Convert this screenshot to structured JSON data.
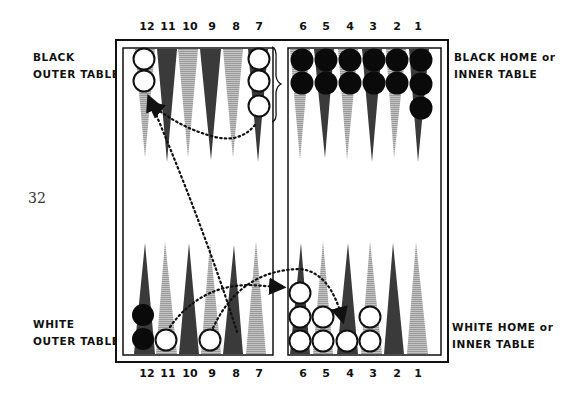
{
  "page_number": "32",
  "labels": {
    "black_outer": [
      "BLACK",
      "OUTER TABLE"
    ],
    "black_home": [
      "BLACK HOME or",
      "INNER TABLE"
    ],
    "white_outer": [
      "WHITE",
      "OUTER TABLE"
    ],
    "white_home": [
      "WHITE HOME or",
      "INNER TABLE"
    ]
  },
  "point_numbers_top": [
    "12",
    "11",
    "10",
    "9",
    "8",
    "7",
    "6",
    "5",
    "4",
    "3",
    "2",
    "1"
  ],
  "point_numbers_bottom": [
    "12",
    "11",
    "10",
    "9",
    "8",
    "7",
    "6",
    "5",
    "4",
    "3",
    "2",
    "1"
  ],
  "colors": {
    "dark_point": "#3a3a3a",
    "light_point": "#b9b9b9",
    "black_checker": "#0a0a0a",
    "white_checker": "#ffffff",
    "frame": "#111111"
  },
  "board": {
    "top_points": [
      {
        "point": 12,
        "shade": "light",
        "checkers": 2,
        "color": "white"
      },
      {
        "point": 11,
        "shade": "dark",
        "checkers": 0
      },
      {
        "point": 10,
        "shade": "light",
        "checkers": 0
      },
      {
        "point": 9,
        "shade": "dark",
        "checkers": 0
      },
      {
        "point": 8,
        "shade": "light",
        "checkers": 0
      },
      {
        "point": 7,
        "shade": "dark",
        "checkers": 3,
        "color": "white"
      },
      {
        "point": 6,
        "shade": "light",
        "checkers": 2,
        "color": "black"
      },
      {
        "point": 5,
        "shade": "dark",
        "checkers": 2,
        "color": "black"
      },
      {
        "point": 4,
        "shade": "light",
        "checkers": 2,
        "color": "black"
      },
      {
        "point": 3,
        "shade": "dark",
        "checkers": 2,
        "color": "black"
      },
      {
        "point": 2,
        "shade": "light",
        "checkers": 2,
        "color": "black"
      },
      {
        "point": 1,
        "shade": "dark",
        "checkers": 3,
        "color": "black"
      }
    ],
    "bottom_points": [
      {
        "point": 12,
        "shade": "dark",
        "checkers": 2,
        "color": "black"
      },
      {
        "point": 11,
        "shade": "light",
        "checkers": 1,
        "color": "white"
      },
      {
        "point": 10,
        "shade": "dark",
        "checkers": 0
      },
      {
        "point": 9,
        "shade": "light",
        "checkers": 1,
        "color": "white"
      },
      {
        "point": 8,
        "shade": "dark",
        "checkers": 0
      },
      {
        "point": 7,
        "shade": "light",
        "checkers": 0
      },
      {
        "point": 6,
        "shade": "dark",
        "checkers": 3,
        "color": "white"
      },
      {
        "point": 5,
        "shade": "light",
        "checkers": 2,
        "color": "white"
      },
      {
        "point": 4,
        "shade": "dark",
        "checkers": 1,
        "color": "white"
      },
      {
        "point": 3,
        "shade": "light",
        "checkers": 2,
        "color": "white"
      },
      {
        "point": 2,
        "shade": "dark",
        "checkers": 0
      },
      {
        "point": 1,
        "shade": "light",
        "checkers": 0
      }
    ],
    "move_arrows": [
      {
        "from": "top-7",
        "to": "top-12",
        "style": "dotted arc"
      },
      {
        "from": "bottom-8",
        "to": "top-12",
        "style": "dotted diagonal"
      },
      {
        "from": "bottom-11",
        "to": "bar",
        "style": "dotted arc"
      },
      {
        "from": "bottom-9",
        "to": "bottom-4",
        "style": "dotted arc"
      }
    ]
  }
}
